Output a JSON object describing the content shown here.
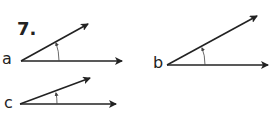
{
  "problem": {
    "number": "7.",
    "angles": [
      {
        "label": "a",
        "vertex": [
          21,
          61
        ],
        "ray1_end": [
          122,
          61
        ],
        "ray2_end": [
          88,
          24
        ]
      },
      {
        "label": "b",
        "vertex": [
          167,
          65
        ],
        "ray1_end": [
          268,
          65
        ],
        "ray2_end": [
          257,
          16
        ]
      },
      {
        "label": "c",
        "vertex": [
          20,
          104
        ],
        "ray1_end": [
          116,
          104
        ],
        "ray2_end": [
          90,
          78
        ]
      }
    ]
  },
  "colors": {
    "ink": "#222222",
    "arc": "#444444"
  }
}
